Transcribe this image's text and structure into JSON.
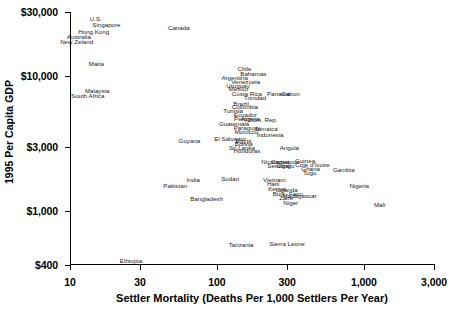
{
  "chart_data": {
    "type": "scatter",
    "title": "",
    "xlabel": "Settler Mortality (Deaths Per 1,000 Settlers Per Year)",
    "ylabel": "1995 Per Capita GDP",
    "xscale": "log",
    "yscale": "log",
    "xlim": [
      10,
      3000
    ],
    "ylim": [
      400,
      30000
    ],
    "xticks": [
      "10",
      "30",
      "100",
      "300",
      "1,000",
      "3,000"
    ],
    "xtick_values": [
      10,
      30,
      100,
      300,
      1000,
      3000
    ],
    "yticks": [
      "$400",
      "$1,000",
      "$3,000",
      "$10,000",
      "$30,000"
    ],
    "ytick_values": [
      400,
      1000,
      3000,
      10000,
      30000
    ],
    "grid": false,
    "legend": false,
    "marker_style": "text-label-only",
    "points": [
      {
        "label": "U.S.",
        "x": 15.0,
        "y": 26500
      },
      {
        "label": "Singapore",
        "x": 17.7,
        "y": 24200
      },
      {
        "label": "Hong Kong",
        "x": 14.5,
        "y": 21500
      },
      {
        "label": "Australia",
        "x": 11.5,
        "y": 19700
      },
      {
        "label": "New Zeland",
        "x": 11.1,
        "y": 18100
      },
      {
        "label": "Canada",
        "x": 55.0,
        "y": 22800
      },
      {
        "label": "Malta",
        "x": 15.1,
        "y": 12400
      },
      {
        "label": "Chile",
        "x": 154.0,
        "y": 11300
      },
      {
        "label": "Bahamas",
        "x": 177.0,
        "y": 10500
      },
      {
        "label": "Argentina",
        "x": 132.0,
        "y": 9750
      },
      {
        "label": "Venezuela",
        "x": 157.0,
        "y": 9150
      },
      {
        "label": "Uruguay",
        "x": 139.0,
        "y": 8500
      },
      {
        "label": "Mexico",
        "x": 140.0,
        "y": 8050
      },
      {
        "label": "Malaysia",
        "x": 15.3,
        "y": 7750
      },
      {
        "label": "Costa Rica",
        "x": 160.0,
        "y": 7450
      },
      {
        "label": "South Africa",
        "x": 13.2,
        "y": 7150
      },
      {
        "label": "Trinidad",
        "x": 182.0,
        "y": 6900
      },
      {
        "label": "Brazil",
        "x": 146.0,
        "y": 6250
      },
      {
        "label": "Colombia",
        "x": 155.0,
        "y": 5900
      },
      {
        "label": "Tunisia",
        "x": 129.0,
        "y": 5550
      },
      {
        "label": "Ecuador",
        "x": 156.0,
        "y": 5180
      },
      {
        "label": "Peru",
        "x": 145.0,
        "y": 4800
      },
      {
        "label": "Algeria",
        "x": 169.0,
        "y": 4800
      },
      {
        "label": "Dom. Rep.",
        "x": 205.0,
        "y": 4780
      },
      {
        "label": "Panama",
        "x": 262.0,
        "y": 7380
      },
      {
        "label": "Gabon",
        "x": 316.0,
        "y": 7420
      },
      {
        "label": "Guatemala",
        "x": 131.0,
        "y": 4450
      },
      {
        "label": "Paraguay",
        "x": 160.0,
        "y": 4150
      },
      {
        "label": "Jamaica",
        "x": 216.0,
        "y": 4100
      },
      {
        "label": "Morocco",
        "x": 159.0,
        "y": 3870
      },
      {
        "label": "Indonesia",
        "x": 230.0,
        "y": 3680
      },
      {
        "label": "El Salvador",
        "x": 123.0,
        "y": 3460
      },
      {
        "label": "Egypt",
        "x": 152.0,
        "y": 3300
      },
      {
        "label": "Bolivia",
        "x": 152.0,
        "y": 3130
      },
      {
        "label": "Guyana",
        "x": 65.0,
        "y": 3330
      },
      {
        "label": "Sri Lanka",
        "x": 148.0,
        "y": 2950
      },
      {
        "label": "Honduras",
        "x": 160.0,
        "y": 2780
      },
      {
        "label": "Angola",
        "x": 311.0,
        "y": 2970
      },
      {
        "label": "Nicaragua",
        "x": 250.0,
        "y": 2330
      },
      {
        "label": "Guinea",
        "x": 398.0,
        "y": 2340
      },
      {
        "label": "Cameroon",
        "x": 292.0,
        "y": 2320
      },
      {
        "label": "Cote d'Ivoire",
        "x": 447.0,
        "y": 2200
      },
      {
        "label": "Senegal",
        "x": 263.0,
        "y": 2160
      },
      {
        "label": "Congo",
        "x": 292.0,
        "y": 2150
      },
      {
        "label": "Ghana",
        "x": 434.0,
        "y": 2060
      },
      {
        "label": "India",
        "x": 69.0,
        "y": 1720
      },
      {
        "label": "Sudan",
        "x": 123.0,
        "y": 1740
      },
      {
        "label": "Togo",
        "x": 428.0,
        "y": 1930
      },
      {
        "label": "Gambia",
        "x": 730.0,
        "y": 2030
      },
      {
        "label": "Pakistan",
        "x": 52.0,
        "y": 1530
      },
      {
        "label": "Vietnam",
        "x": 246.0,
        "y": 1720
      },
      {
        "label": "Haiti",
        "x": 241.0,
        "y": 1590
      },
      {
        "label": "Uganda",
        "x": 299.0,
        "y": 1440
      },
      {
        "label": "Kenya",
        "x": 256.0,
        "y": 1460
      },
      {
        "label": "Burk. Faso",
        "x": 303.0,
        "y": 1340
      },
      {
        "label": "Nigeria",
        "x": 930.0,
        "y": 1530
      },
      {
        "label": "Zaire",
        "x": 296.0,
        "y": 1250
      },
      {
        "label": "Madagascar",
        "x": 365.0,
        "y": 1300
      },
      {
        "label": "Bangladesh",
        "x": 85.0,
        "y": 1230
      },
      {
        "label": "Niger",
        "x": 318.0,
        "y": 1150
      },
      {
        "label": "Mali",
        "x": 1280.0,
        "y": 1120
      },
      {
        "label": "Tanzania",
        "x": 146.0,
        "y": 565
      },
      {
        "label": "Sierra Leone",
        "x": 300.0,
        "y": 570
      },
      {
        "label": "Ethiopia",
        "x": 26.0,
        "y": 430
      }
    ]
  }
}
